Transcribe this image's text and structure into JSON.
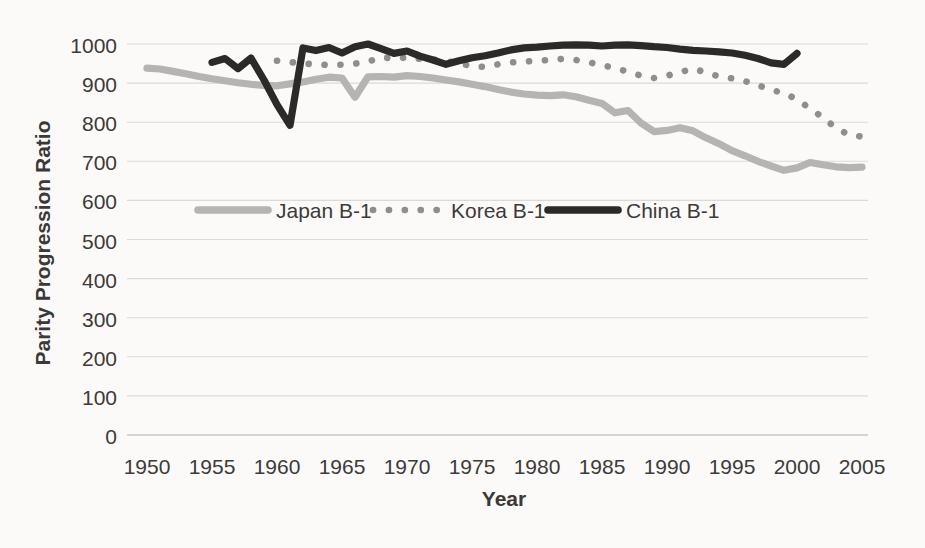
{
  "chart_data": {
    "type": "line",
    "title": "",
    "xlabel": "Year",
    "ylabel": "Parity Progression Ratio",
    "x_ticks": [
      1950,
      1955,
      1960,
      1965,
      1970,
      1975,
      1980,
      1985,
      1990,
      1995,
      2000,
      2005
    ],
    "y_ticks": [
      0,
      100,
      200,
      300,
      400,
      500,
      600,
      700,
      800,
      900,
      1000
    ],
    "xlim": [
      1948.5,
      2006
    ],
    "ylim": [
      0,
      1030
    ],
    "grid": "horizontal-only",
    "legend_position": "inside-plot, single row near the 600 gridline",
    "style": {
      "background": "#fbfaf8",
      "text_color": "#3c3b39",
      "gridline_color": "#dbd9d5",
      "zero_line_color": "#c6c4c0"
    },
    "series": [
      {
        "name": "Japan B-1",
        "color": "#b6b4b1",
        "line_style": "solid",
        "points": [
          [
            1950,
            938
          ],
          [
            1951,
            936
          ],
          [
            1952,
            930
          ],
          [
            1953,
            924
          ],
          [
            1954,
            917
          ],
          [
            1955,
            911
          ],
          [
            1956,
            906
          ],
          [
            1957,
            901
          ],
          [
            1958,
            897
          ],
          [
            1959,
            894
          ],
          [
            1960,
            893
          ],
          [
            1961,
            898
          ],
          [
            1962,
            903
          ],
          [
            1963,
            910
          ],
          [
            1964,
            915
          ],
          [
            1965,
            913
          ],
          [
            1966,
            864
          ],
          [
            1967,
            916
          ],
          [
            1968,
            917
          ],
          [
            1969,
            915
          ],
          [
            1970,
            919
          ],
          [
            1971,
            917
          ],
          [
            1972,
            913
          ],
          [
            1973,
            908
          ],
          [
            1974,
            903
          ],
          [
            1975,
            897
          ],
          [
            1976,
            891
          ],
          [
            1977,
            884
          ],
          [
            1978,
            877
          ],
          [
            1979,
            872
          ],
          [
            1980,
            869
          ],
          [
            1981,
            868
          ],
          [
            1982,
            870
          ],
          [
            1983,
            865
          ],
          [
            1984,
            856
          ],
          [
            1985,
            848
          ],
          [
            1986,
            824
          ],
          [
            1987,
            830
          ],
          [
            1988,
            798
          ],
          [
            1989,
            776
          ],
          [
            1990,
            779
          ],
          [
            1991,
            786
          ],
          [
            1992,
            778
          ],
          [
            1993,
            760
          ],
          [
            1994,
            745
          ],
          [
            1995,
            727
          ],
          [
            1996,
            714
          ],
          [
            1997,
            700
          ],
          [
            1998,
            688
          ],
          [
            1999,
            677
          ],
          [
            2000,
            683
          ],
          [
            2001,
            697
          ],
          [
            2002,
            691
          ],
          [
            2003,
            686
          ],
          [
            2004,
            684
          ],
          [
            2005,
            685
          ]
        ]
      },
      {
        "name": "Korea B-1",
        "color": "#908e8b",
        "line_style": "dotted",
        "points": [
          [
            1960,
            957
          ],
          [
            1961,
            954
          ],
          [
            1962,
            950
          ],
          [
            1963,
            948
          ],
          [
            1964,
            946
          ],
          [
            1965,
            947
          ],
          [
            1966,
            950
          ],
          [
            1967,
            955
          ],
          [
            1968,
            966
          ],
          [
            1969,
            963
          ],
          [
            1970,
            966
          ],
          [
            1971,
            962
          ],
          [
            1972,
            960
          ],
          [
            1973,
            957
          ],
          [
            1974,
            950
          ],
          [
            1975,
            944
          ],
          [
            1976,
            941
          ],
          [
            1977,
            948
          ],
          [
            1978,
            953
          ],
          [
            1979,
            955
          ],
          [
            1980,
            957
          ],
          [
            1981,
            959
          ],
          [
            1982,
            962
          ],
          [
            1983,
            959
          ],
          [
            1984,
            953
          ],
          [
            1985,
            946
          ],
          [
            1986,
            938
          ],
          [
            1987,
            929
          ],
          [
            1988,
            919
          ],
          [
            1989,
            913
          ],
          [
            1990,
            919
          ],
          [
            1991,
            928
          ],
          [
            1992,
            937
          ],
          [
            1993,
            927
          ],
          [
            1994,
            917
          ],
          [
            1995,
            912
          ],
          [
            1996,
            905
          ],
          [
            1997,
            895
          ],
          [
            1998,
            882
          ],
          [
            1999,
            875
          ],
          [
            2000,
            858
          ],
          [
            2001,
            835
          ],
          [
            2002,
            812
          ],
          [
            2003,
            785
          ],
          [
            2004,
            768
          ],
          [
            2005,
            763
          ]
        ]
      },
      {
        "name": "China B-1",
        "color": "#2b2a28",
        "line_style": "solid",
        "points": [
          [
            1955,
            953
          ],
          [
            1956,
            963
          ],
          [
            1957,
            937
          ],
          [
            1958,
            964
          ],
          [
            1959,
            908
          ],
          [
            1960,
            845
          ],
          [
            1961,
            792
          ],
          [
            1962,
            990
          ],
          [
            1963,
            983
          ],
          [
            1964,
            991
          ],
          [
            1965,
            977
          ],
          [
            1966,
            993
          ],
          [
            1967,
            1000
          ],
          [
            1968,
            988
          ],
          [
            1969,
            976
          ],
          [
            1970,
            982
          ],
          [
            1971,
            969
          ],
          [
            1972,
            959
          ],
          [
            1973,
            948
          ],
          [
            1974,
            957
          ],
          [
            1975,
            965
          ],
          [
            1976,
            970
          ],
          [
            1977,
            977
          ],
          [
            1978,
            985
          ],
          [
            1979,
            990
          ],
          [
            1980,
            992
          ],
          [
            1981,
            995
          ],
          [
            1982,
            997
          ],
          [
            1983,
            998
          ],
          [
            1984,
            997
          ],
          [
            1985,
            995
          ],
          [
            1986,
            997
          ],
          [
            1987,
            998
          ],
          [
            1988,
            996
          ],
          [
            1989,
            993
          ],
          [
            1990,
            991
          ],
          [
            1991,
            987
          ],
          [
            1992,
            984
          ],
          [
            1993,
            982
          ],
          [
            1994,
            980
          ],
          [
            1995,
            977
          ],
          [
            1996,
            971
          ],
          [
            1997,
            963
          ],
          [
            1998,
            952
          ],
          [
            1999,
            948
          ],
          [
            2000,
            976
          ]
        ]
      }
    ]
  }
}
